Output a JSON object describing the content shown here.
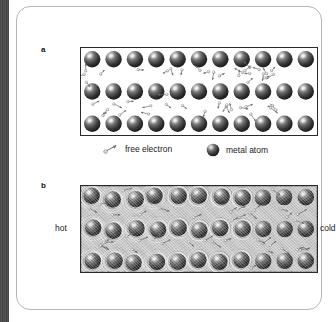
{
  "figure": {
    "panels": [
      {
        "letter": "a",
        "name": "metal-lattice-cool",
        "background": "#ffffff",
        "rows": 3,
        "atoms_per_row": 11
      },
      {
        "letter": "b",
        "name": "metal-lattice-heated",
        "background": "#c9c9c9",
        "rows": 3,
        "atoms_per_row": 11
      }
    ]
  },
  "legend": {
    "electron": {
      "icon": "free-electron-icon",
      "label": "free electron"
    },
    "atom": {
      "icon": "metal-atom-icon",
      "label": "metal atom"
    }
  },
  "panel_b_labels": {
    "left": "hot",
    "right": "cold"
  },
  "colors": {
    "atom_dark": "#2b2b2b",
    "atom_mid": "#5c5c5c",
    "atom_highlight": "#e8e8e8",
    "panel_a_bg": "#ffffff",
    "panel_b_bg": "#c9c9c9",
    "border": "#2a2a2a",
    "card_border": "#b7b7b7",
    "gutter": "#4a4a4a",
    "text": "#1a1a1a"
  },
  "chart_data": {
    "type": "diagram",
    "panels": [
      {
        "id": "a",
        "label": "a",
        "background": "white",
        "atom_rows": 3,
        "atoms_per_row": 11,
        "total_atoms": 33,
        "free_electrons": 46,
        "vibration": false,
        "annotation": null
      },
      {
        "id": "b",
        "label": "b",
        "background": "grey",
        "atom_rows": 3,
        "atoms_per_row": 11,
        "total_atoms": 33,
        "free_electrons": 40,
        "vibration": true,
        "vibration_gradient": "strong at left (hot) decreasing to right (cold)",
        "annotation": {
          "left": "hot",
          "right": "cold"
        }
      }
    ],
    "legend_entries": [
      "free electron",
      "metal atom"
    ]
  }
}
